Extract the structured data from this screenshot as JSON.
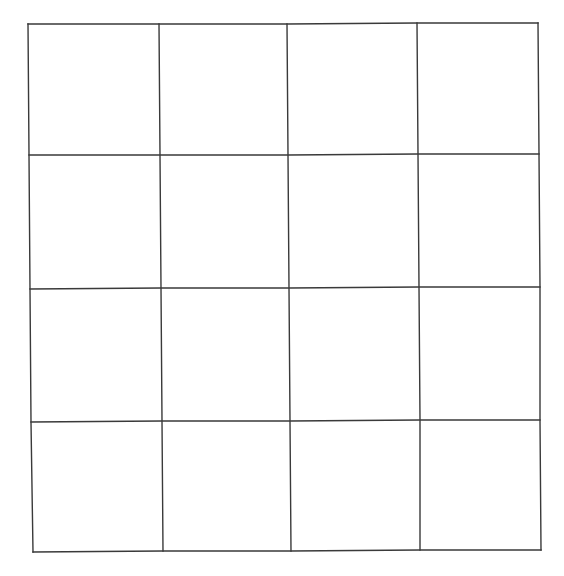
{
  "diagram": {
    "type": "grid",
    "rows": 4,
    "columns": 4,
    "line_color": "#3a3a3a",
    "background": "#ffffff",
    "cells_filled": false,
    "lattice_points": [
      [
        [
          28,
          24
        ],
        [
          159,
          24
        ],
        [
          287,
          24
        ],
        [
          417,
          23
        ],
        [
          538,
          23
        ]
      ],
      [
        [
          29,
          155
        ],
        [
          160,
          155
        ],
        [
          288,
          155
        ],
        [
          418,
          154
        ],
        [
          539,
          154
        ]
      ],
      [
        [
          30,
          289
        ],
        [
          161,
          288
        ],
        [
          289,
          288
        ],
        [
          419,
          287
        ],
        [
          540,
          287
        ]
      ],
      [
        [
          31,
          422
        ],
        [
          162,
          421
        ],
        [
          290,
          421
        ],
        [
          420,
          420
        ],
        [
          540,
          420
        ]
      ],
      [
        [
          33,
          552
        ],
        [
          163,
          551
        ],
        [
          291,
          551
        ],
        [
          420,
          550
        ],
        [
          541,
          550
        ]
      ]
    ]
  }
}
